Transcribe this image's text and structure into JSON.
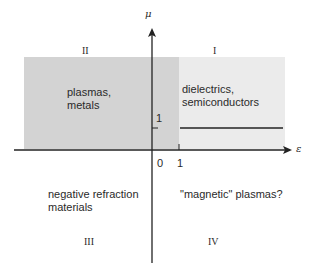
{
  "diagram": {
    "axes": {
      "x_label": "ε",
      "y_label": "μ",
      "x_ticks": [
        "0",
        "1"
      ],
      "y_ticks": [
        "1"
      ]
    },
    "quadrants": [
      {
        "id": "I",
        "numeral": "I",
        "label": "dielectrics,\nsemiconductors",
        "fill": "#ebebeb"
      },
      {
        "id": "II",
        "numeral": "II",
        "label": "plasmas,\nmetals",
        "fill": "#d3d3d3"
      },
      {
        "id": "III",
        "numeral": "III",
        "label": "negative refraction\nmaterials",
        "fill": "#ffffff"
      },
      {
        "id": "IV",
        "numeral": "IV",
        "label": "\"magnetic\" plasmas?",
        "fill": "#ffffff"
      }
    ],
    "line_mu_equals_1": {
      "color": "#555555"
    }
  }
}
